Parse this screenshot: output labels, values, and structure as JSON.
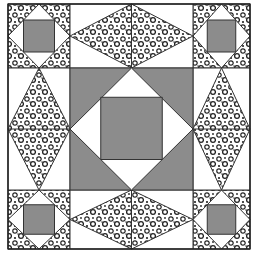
{
  "figure": {
    "type": "quilt-block-pattern",
    "width": 254,
    "height": 254,
    "colors": {
      "background": "#ffffff",
      "solid_gray": "#8c8c8c",
      "print_dark": "#2a2a2a",
      "outline": "#333333"
    },
    "grid": {
      "x": [
        8,
        70,
        193,
        250
      ],
      "y": [
        4,
        68,
        190,
        249
      ]
    },
    "blocks": {
      "corners": [
        "top-left",
        "top-right",
        "bottom-left",
        "bottom-right"
      ],
      "edges_horizontal": [
        "top-center",
        "bottom-center"
      ],
      "edges_vertical": [
        "middle-left",
        "middle-right"
      ],
      "center": "square-in-a-square"
    }
  }
}
